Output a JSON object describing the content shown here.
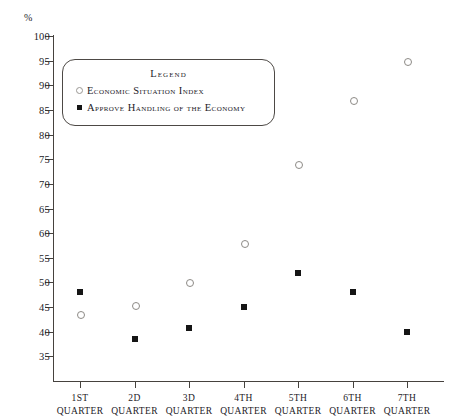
{
  "chart_data": {
    "type": "scatter",
    "title": "",
    "xlabel": "",
    "ylabel": "%",
    "ylim": [
      30,
      100
    ],
    "yticks": [
      100,
      95,
      90,
      85,
      80,
      75,
      70,
      65,
      60,
      55,
      50,
      45,
      40,
      35
    ],
    "grid": false,
    "legend_position": "upper-left-inside",
    "categories": [
      "1ST QUARTER",
      "2D QUARTER",
      "3D QUARTER",
      "4TH QUARTER",
      "5TH QUARTER",
      "6TH QUARTER",
      "7TH QUARTER"
    ],
    "category_parts": [
      {
        "ordinal": "1ST",
        "unit": "QUARTER"
      },
      {
        "ordinal": "2D",
        "unit": "QUARTER"
      },
      {
        "ordinal": "3D",
        "unit": "QUARTER"
      },
      {
        "ordinal": "4TH",
        "unit": "QUARTER"
      },
      {
        "ordinal": "5TH",
        "unit": "QUARTER"
      },
      {
        "ordinal": "6TH",
        "unit": "QUARTER"
      },
      {
        "ordinal": "7TH",
        "unit": "QUARTER"
      }
    ],
    "series": [
      {
        "name": "Economic Situation Index",
        "marker": "open-circle",
        "color": "#8d8a86",
        "values": [
          43.5,
          45.5,
          50,
          58,
          74,
          87,
          95
        ]
      },
      {
        "name": "Approve Handling of the Economy",
        "marker": "filled-square",
        "color": "#151515",
        "values": [
          48,
          38.5,
          40.7,
          45,
          52,
          48,
          40
        ]
      }
    ]
  },
  "axis": {
    "unit_label": "%"
  },
  "legend": {
    "title": "Legend",
    "entries": [
      {
        "label": "Economic Situation Index",
        "marker": "open-circle"
      },
      {
        "label": "Approve Handling of the Economy",
        "marker": "filled-square"
      }
    ]
  }
}
